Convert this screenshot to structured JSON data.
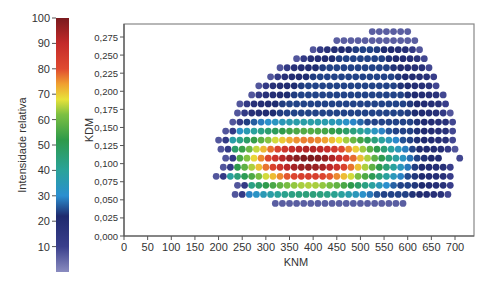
{
  "chart_data": {
    "type": "scatter",
    "title": "",
    "xlabel": "KNM",
    "ylabel": "KDM",
    "xlim": [
      0,
      750
    ],
    "ylim": [
      0,
      0.29
    ],
    "x_ticks": [
      "0",
      "50",
      "100",
      "150",
      "200",
      "250",
      "300",
      "350",
      "400",
      "450",
      "500",
      "550",
      "600",
      "650",
      "700"
    ],
    "x_tick_values": [
      0,
      50,
      100,
      150,
      200,
      250,
      300,
      350,
      400,
      450,
      500,
      550,
      600,
      650,
      700
    ],
    "y_ticks": [
      "0,000",
      "0,025",
      "0,050",
      "0,075",
      "0,100",
      "0,125",
      "0,150",
      "0,175",
      "0,200",
      "0,225",
      "0,250",
      "0,275"
    ],
    "y_tick_values": [
      0,
      0.025,
      0.05,
      0.075,
      0.1,
      0.125,
      0.15,
      0.175,
      0.2,
      0.225,
      0.25,
      0.275
    ],
    "grid": false,
    "colorbar": {
      "label": "Intensidade relativa",
      "ticks": [
        "10",
        "20",
        "30",
        "40",
        "50",
        "60",
        "70",
        "80",
        "90",
        "100"
      ],
      "tick_values": [
        10,
        20,
        30,
        40,
        50,
        60,
        70,
        80,
        90,
        100
      ],
      "range": [
        0,
        100
      ],
      "stops": [
        {
          "v": 0,
          "color": "#8a8cc0"
        },
        {
          "v": 10,
          "color": "#3a3f8c"
        },
        {
          "v": 22,
          "color": "#1f2a6e"
        },
        {
          "v": 30,
          "color": "#2b8fd0"
        },
        {
          "v": 40,
          "color": "#2aa39a"
        },
        {
          "v": 52,
          "color": "#2e9a4a"
        },
        {
          "v": 62,
          "color": "#7dc042"
        },
        {
          "v": 68,
          "color": "#e8e23a"
        },
        {
          "v": 74,
          "color": "#f0a030"
        },
        {
          "v": 80,
          "color": "#e04a30"
        },
        {
          "v": 90,
          "color": "#c42a2a"
        },
        {
          "v": 100,
          "color": "#7a1a1e"
        }
      ]
    },
    "point_spacing_knm": 15,
    "peak": {
      "knm": 390,
      "kdm": 0.105,
      "intensity": 100
    },
    "rows": [
      {
        "kdm": 0.2825,
        "knm_min": 525,
        "knm_max": 610
      },
      {
        "kdm": 0.27,
        "knm_min": 450,
        "knm_max": 625
      },
      {
        "kdm": 0.2575,
        "knm_min": 400,
        "knm_max": 625
      },
      {
        "kdm": 0.245,
        "knm_min": 365,
        "knm_max": 640
      },
      {
        "kdm": 0.2325,
        "knm_min": 330,
        "knm_max": 650
      },
      {
        "kdm": 0.22,
        "knm_min": 310,
        "knm_max": 665
      },
      {
        "kdm": 0.2075,
        "knm_min": 285,
        "knm_max": 665
      },
      {
        "kdm": 0.195,
        "knm_min": 270,
        "knm_max": 680
      },
      {
        "kdm": 0.1825,
        "knm_min": 245,
        "knm_max": 690
      },
      {
        "kdm": 0.17,
        "knm_min": 240,
        "knm_max": 690
      },
      {
        "kdm": 0.1575,
        "knm_min": 230,
        "knm_max": 700
      },
      {
        "kdm": 0.145,
        "knm_min": 215,
        "knm_max": 700
      },
      {
        "kdm": 0.1325,
        "knm_min": 200,
        "knm_max": 700
      },
      {
        "kdm": 0.12,
        "knm_min": 205,
        "knm_max": 700
      },
      {
        "kdm": 0.1075,
        "knm_min": 215,
        "knm_max": 715
      },
      {
        "kdm": 0.095,
        "knm_min": 210,
        "knm_max": 700
      },
      {
        "kdm": 0.0825,
        "knm_min": 195,
        "knm_max": 700
      },
      {
        "kdm": 0.07,
        "knm_min": 240,
        "knm_max": 700
      },
      {
        "kdm": 0.0575,
        "knm_min": 235,
        "knm_max": 690
      },
      {
        "kdm": 0.045,
        "knm_min": 320,
        "knm_max": 600
      }
    ]
  }
}
